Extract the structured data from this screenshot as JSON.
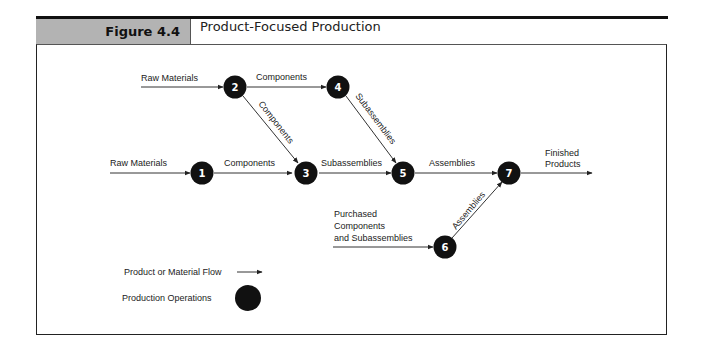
{
  "header": {
    "figure_number": "Figure 4.4",
    "title": "Product-Focused Production"
  },
  "diagram": {
    "nodes": [
      {
        "id": "1",
        "label": "1"
      },
      {
        "id": "2",
        "label": "2"
      },
      {
        "id": "3",
        "label": "3"
      },
      {
        "id": "4",
        "label": "4"
      },
      {
        "id": "5",
        "label": "5"
      },
      {
        "id": "6",
        "label": "6"
      },
      {
        "id": "7",
        "label": "7"
      }
    ],
    "edges": {
      "raw_to_2": "Raw Materials",
      "e2_4": "Components",
      "e2_3": "Components",
      "e4_5": "Subassemblies",
      "raw_to_1": "Raw Materials",
      "e1_3": "Components",
      "e3_5": "Subassemblies",
      "e5_7": "Assemblies",
      "e7_out_line1": "Finished",
      "e7_out_line2": "Products",
      "purchased_line1": "Purchased",
      "purchased_line2": "Components",
      "purchased_line3": "and Subassemblies",
      "e6_7": "Assemblies"
    }
  },
  "legend": {
    "flow_label": "Product or Material Flow",
    "operations_label": "Production Operations"
  },
  "colors": {
    "header_gray": "#b3b3b3",
    "node_fill": "#111111",
    "line": "#333333"
  }
}
